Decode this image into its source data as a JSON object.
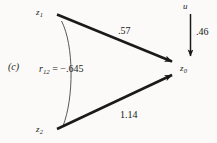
{
  "figure": {
    "panel_id": "(c)",
    "type": "path-diagram",
    "background_color": "#fbfaf8",
    "line_color": "#1a1a1a"
  },
  "nodes": [
    {
      "id": "z1",
      "label": "z",
      "subscript": "1",
      "role": "exogenous-predictor"
    },
    {
      "id": "z2",
      "label": "z",
      "subscript": "2",
      "role": "exogenous-predictor"
    },
    {
      "id": "z0",
      "label": "z",
      "subscript": "0",
      "role": "outcome"
    },
    {
      "id": "u",
      "label": "u",
      "subscript": "",
      "role": "disturbance"
    }
  ],
  "paths": [
    {
      "from": "z1",
      "to": "z0",
      "coefficient": ".57",
      "kind": "directed"
    },
    {
      "from": "z2",
      "to": "z0",
      "coefficient": "1.14",
      "kind": "directed"
    },
    {
      "from": "u",
      "to": "z0",
      "coefficient": ".46",
      "kind": "directed"
    }
  ],
  "correlation": {
    "symbol": "r",
    "subscript": "12",
    "equals": "=",
    "value": "−.645",
    "between": [
      "z1",
      "z2"
    ],
    "kind": "curved-undirected"
  }
}
